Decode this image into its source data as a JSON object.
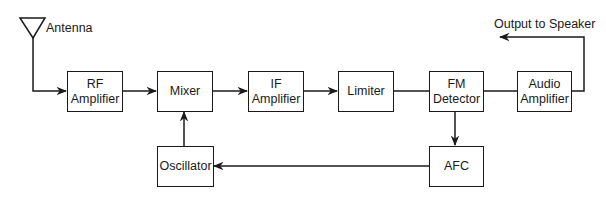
{
  "labels": {
    "antenna": "Antenna",
    "output": "Output to Speaker"
  },
  "blocks": {
    "rf_amplifier": "RF\nAmplifier",
    "mixer": "Mixer",
    "if_amplifier": "IF\nAmplifier",
    "limiter": "Limiter",
    "fm_detector": "FM\nDetector",
    "audio_amplifier": "Audio\nAmplifier",
    "oscillator": "Oscillator",
    "afc": "AFC"
  },
  "connections": [
    {
      "from": "Antenna",
      "to": "RF Amplifier",
      "arrow": true
    },
    {
      "from": "RF Amplifier",
      "to": "Mixer",
      "arrow": true
    },
    {
      "from": "Mixer",
      "to": "IF Amplifier",
      "arrow": true
    },
    {
      "from": "IF Amplifier",
      "to": "Limiter",
      "arrow": true
    },
    {
      "from": "Limiter",
      "to": "FM Detector",
      "arrow": false
    },
    {
      "from": "FM Detector",
      "to": "Audio Amplifier",
      "arrow": false
    },
    {
      "from": "Audio Amplifier",
      "to": "Output to Speaker",
      "arrow": true
    },
    {
      "from": "FM Detector",
      "to": "AFC",
      "arrow": true
    },
    {
      "from": "AFC",
      "to": "Oscillator",
      "arrow": true
    },
    {
      "from": "Oscillator",
      "to": "Mixer",
      "arrow": true
    }
  ],
  "colors": {
    "line": "#1a1a1a",
    "background": "#ffffff"
  }
}
